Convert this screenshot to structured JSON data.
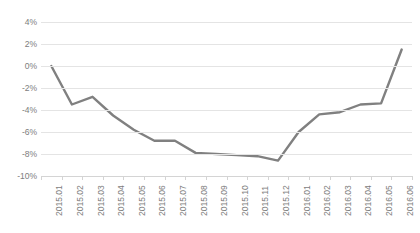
{
  "chart_data": {
    "type": "line",
    "title": "",
    "subtitle": "",
    "xlabel": "",
    "ylabel": "",
    "categories": [
      "2015.01",
      "2015.02",
      "2015.03",
      "2015.04",
      "2015.05",
      "2015.06",
      "2015.07",
      "2015.08",
      "2015.09",
      "2015.10",
      "2015.11",
      "2015.12",
      "2016.01",
      "2016.02",
      "2016.03",
      "2016.04",
      "2016.05",
      "2016.06"
    ],
    "values": [
      0.0,
      -3.5,
      -2.8,
      -4.5,
      -5.8,
      -6.8,
      -6.8,
      -7.9,
      -8.0,
      -8.1,
      -8.2,
      -8.6,
      -6.0,
      -4.4,
      -4.2,
      -3.5,
      -3.4,
      1.5
    ],
    "series": [
      {
        "name": "",
        "values": [
          0.0,
          -3.5,
          -2.8,
          -4.5,
          -5.8,
          -6.8,
          -6.8,
          -7.9,
          -8.0,
          -8.1,
          -8.2,
          -8.6,
          -6.0,
          -4.4,
          -4.2,
          -3.5,
          -3.4,
          1.5
        ],
        "color": "#808080"
      }
    ],
    "ylim": [
      -10,
      4
    ],
    "ytick_values": [
      4,
      2,
      0,
      -2,
      -4,
      -6,
      -8,
      -10
    ],
    "ytick_labels": [
      "4%",
      "2%",
      "0%",
      "-2%",
      "-4%",
      "-6%",
      "-8%",
      "-10%"
    ],
    "grid": "horizontal",
    "legend": "none",
    "markers": false,
    "line_width": 2.4,
    "value_suffix": "%",
    "annotations": []
  },
  "colors": {
    "line": "#808080",
    "gridline": "#e4e4e4",
    "axis": "#d4d4d4",
    "tick_text": "#7d7d7d",
    "background": "#ffffff"
  }
}
